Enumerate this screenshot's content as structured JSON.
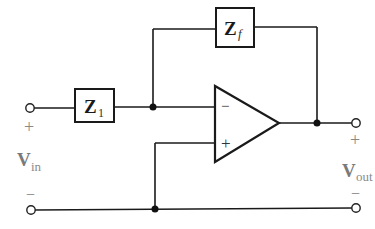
{
  "diagram": {
    "type": "inverting op-amp circuit",
    "components": {
      "input_impedance": {
        "symbol": "Z",
        "subscript": "1"
      },
      "feedback_impedance": {
        "symbol": "Z",
        "subscript": "f"
      },
      "opamp": {
        "inverting_input_sign": "−",
        "noninverting_input_sign": "+"
      }
    },
    "input": {
      "label": "V",
      "subscript": "in",
      "plus_sign": "+",
      "minus_sign": "−"
    },
    "output": {
      "label": "V",
      "subscript": "out",
      "plus_sign": "+",
      "minus_sign": "−"
    },
    "colors": {
      "wire": "#1a1a1a",
      "label_gray": "#7a7a7a",
      "background": "#ffffff"
    }
  }
}
